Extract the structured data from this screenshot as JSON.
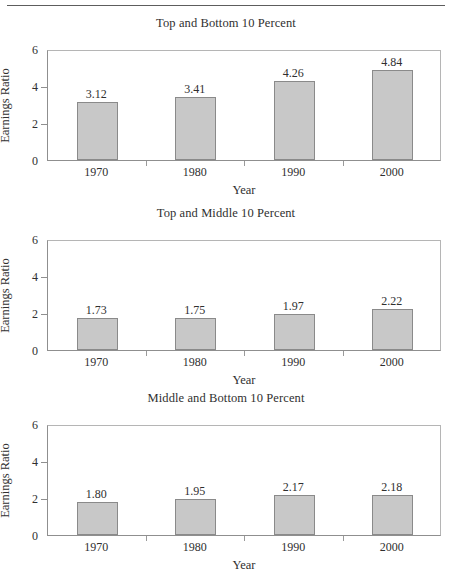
{
  "figure": {
    "axis_label_y": "Earnings Ratio",
    "axis_label_x": "Year",
    "y_ticks": [
      "6",
      "4",
      "2",
      "0"
    ],
    "x_ticks": [
      "1970",
      "1980",
      "1990",
      "2000"
    ],
    "bar_color": "#c8c8c8",
    "bar_border_color": "#8a8a8a",
    "frame_color": "#8f8f8f"
  },
  "chart_data": [
    {
      "type": "bar",
      "title": "Top and Bottom 10 Percent",
      "categories": [
        "1970",
        "1980",
        "1990",
        "2000"
      ],
      "values": [
        3.12,
        3.41,
        4.26,
        4.84
      ],
      "labels": [
        "3.12",
        "3.41",
        "4.26",
        "4.84"
      ],
      "xlabel": "Year",
      "ylabel": "Earnings Ratio",
      "ylim": [
        0,
        6
      ],
      "yticks": [
        0,
        2,
        4,
        6
      ],
      "grid": false,
      "legend": null
    },
    {
      "type": "bar",
      "title": "Top and Middle 10 Percent",
      "categories": [
        "1970",
        "1980",
        "1990",
        "2000"
      ],
      "values": [
        1.73,
        1.75,
        1.97,
        2.22
      ],
      "labels": [
        "1.73",
        "1.75",
        "1.97",
        "2.22"
      ],
      "xlabel": "Year",
      "ylabel": "Earnings Ratio",
      "ylim": [
        0,
        6
      ],
      "yticks": [
        0,
        2,
        4,
        6
      ],
      "grid": false,
      "legend": null
    },
    {
      "type": "bar",
      "title": "Middle and Bottom 10 Percent",
      "categories": [
        "1970",
        "1980",
        "1990",
        "2000"
      ],
      "values": [
        1.8,
        1.95,
        2.17,
        2.18
      ],
      "labels": [
        "1.80",
        "1.95",
        "2.17",
        "2.18"
      ],
      "xlabel": "Year",
      "ylabel": "Earnings Ratio",
      "ylim": [
        0,
        6
      ],
      "yticks": [
        0,
        2,
        4,
        6
      ],
      "grid": false,
      "legend": null
    }
  ]
}
